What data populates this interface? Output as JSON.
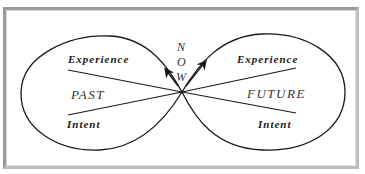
{
  "diagram": {
    "type": "figure-eight / infinity loop",
    "center_label_letters": [
      "N",
      "O",
      "W"
    ],
    "left_loop": {
      "region_label": "PAST",
      "upper_line_label": "Experience",
      "lower_line_label": "Intent"
    },
    "right_loop": {
      "region_label": "FUTURE",
      "upper_line_label": "Experience",
      "lower_line_label": "Intent"
    },
    "colors": {
      "stroke": "#1a1a1a",
      "frame": "#9a9a9a",
      "background": "#ffffff"
    }
  }
}
